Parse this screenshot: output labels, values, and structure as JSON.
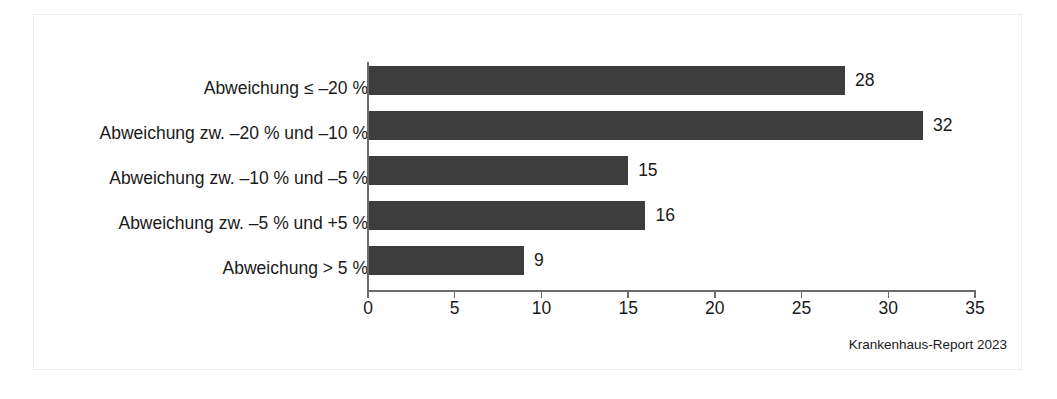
{
  "figure": {
    "attribution": "Krankenhaus-Report 2023",
    "bar_color": "#3d3d3d",
    "text_color": "#1a1a1a",
    "axis_color": "#6b6b6b",
    "frame_color": "#ededed",
    "background": "#ffffff"
  },
  "chart_data": {
    "type": "bar",
    "orientation": "horizontal",
    "title": "",
    "subtitle": "",
    "xlabel": "",
    "ylabel": "",
    "categories": [
      "Abweichung ≤ –20 %",
      "Abweichung zw. –20 % und –10 %",
      "Abweichung zw. –10 % und –5 %",
      "Abweichung zw. –5 % und +5 %",
      "Abweichung > 5 %"
    ],
    "values": [
      28,
      32,
      15,
      16,
      9
    ],
    "bar_extents": [
      27.5,
      32.0,
      15.0,
      16.0,
      9.0
    ],
    "data_labels": [
      "28",
      "32",
      "15",
      "16",
      "9"
    ],
    "xlim": [
      0,
      35
    ],
    "ylim": null,
    "xticks": [
      0,
      5,
      10,
      15,
      20,
      25,
      30,
      35
    ],
    "xtick_labels": [
      "0",
      "5",
      "10",
      "15",
      "20",
      "25",
      "30",
      "35"
    ],
    "grid": false,
    "legend": null,
    "legend_position": "none",
    "annotations": [
      "Krankenhaus-Report 2023"
    ]
  }
}
